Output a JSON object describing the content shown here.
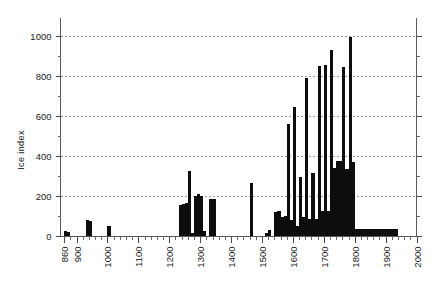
{
  "chart_data": {
    "type": "bar",
    "title": "",
    "subtitle": "",
    "xlabel": "",
    "ylabel": "Ice index",
    "xlim": [
      848,
      2000
    ],
    "ylim": [
      0,
      1060
    ],
    "grid": true,
    "legend": null,
    "bar_width_years": 10,
    "x_tick_labels": [
      "860",
      "900",
      "1000",
      "1100",
      "1200",
      "1300",
      "1400",
      "1500",
      "1600",
      "1700",
      "1800",
      "1900",
      "2000"
    ],
    "x_tick_values": [
      860,
      900,
      1000,
      1100,
      1200,
      1300,
      1400,
      1500,
      1600,
      1700,
      1800,
      1900,
      2000
    ],
    "x_minor_tick_step": 20,
    "y_tick_labels": [
      "0",
      "200",
      "400",
      "600",
      "800",
      "1000"
    ],
    "y_tick_values": [
      0,
      200,
      400,
      600,
      800,
      1000
    ],
    "y_minor_tick_step": 100,
    "categories": [
      860,
      870,
      930,
      940,
      960,
      1000,
      1230,
      1240,
      1250,
      1260,
      1270,
      1280,
      1290,
      1300,
      1310,
      1330,
      1340,
      1460,
      1470,
      1510,
      1520,
      1540,
      1550,
      1560,
      1570,
      1580,
      1590,
      1600,
      1610,
      1620,
      1630,
      1640,
      1650,
      1660,
      1670,
      1680,
      1690,
      1700,
      1710,
      1720,
      1730,
      1740,
      1750,
      1760,
      1770,
      1780,
      1790,
      1800,
      1810,
      1820,
      1830,
      1840,
      1850,
      1860,
      1870,
      1880,
      1890,
      1900,
      1910,
      1920,
      1930
    ],
    "values": [
      30,
      25,
      85,
      80,
      0,
      55,
      160,
      165,
      170,
      330,
      20,
      205,
      215,
      205,
      30,
      190,
      190,
      270,
      0,
      20,
      35,
      125,
      130,
      100,
      105,
      565,
      85,
      650,
      55,
      300,
      100,
      795,
      90,
      320,
      90,
      855,
      130,
      860,
      130,
      935,
      345,
      380,
      380,
      850,
      340,
      1000,
      375,
      40,
      40,
      40,
      40,
      40,
      40,
      40,
      40,
      40,
      40,
      40,
      40,
      40,
      40
    ],
    "series_name": "Ice index",
    "bar_color": "#0d0d0d",
    "grid_color": "#9a9a9a",
    "axis_color": "#5a5a5a"
  },
  "axes": {
    "ylabel_text": "Ice index"
  }
}
